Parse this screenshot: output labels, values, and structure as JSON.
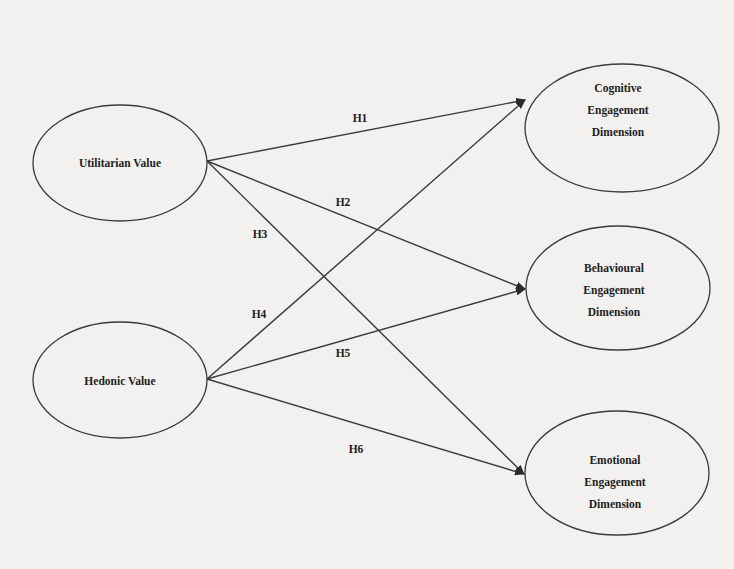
{
  "diagram": {
    "type": "structural-model",
    "nodes": [
      {
        "id": "utilitarian",
        "lines": [
          "Utilitarian Value"
        ]
      },
      {
        "id": "hedonic",
        "lines": [
          "Hedonic Value"
        ]
      },
      {
        "id": "cognitive",
        "lines": [
          "Cognitive",
          "Engagement",
          "Dimension"
        ]
      },
      {
        "id": "behavioural",
        "lines": [
          "Behavioural",
          "Engagement",
          "Dimension"
        ]
      },
      {
        "id": "emotional",
        "lines": [
          "Emotional",
          "Engagement",
          "Dimension"
        ]
      }
    ],
    "edges": [
      {
        "label": "H1",
        "from": "Utilitarian Value",
        "to": "Cognitive Engagement Dimension"
      },
      {
        "label": "H2",
        "from": "Utilitarian Value",
        "to": "Behavioural Engagement Dimension"
      },
      {
        "label": "H3",
        "from": "Utilitarian Value",
        "to": "Emotional Engagement Dimension"
      },
      {
        "label": "H4",
        "from": "Hedonic Value",
        "to": "Cognitive Engagement Dimension"
      },
      {
        "label": "H5",
        "from": "Hedonic Value",
        "to": "Behavioural Engagement Dimension"
      },
      {
        "label": "H6",
        "from": "Hedonic Value",
        "to": "Emotional Engagement Dimension"
      }
    ],
    "colors": {
      "background": "#f2f1ef",
      "stroke": "#3a3a3a",
      "text": "#1e1e1e"
    }
  }
}
